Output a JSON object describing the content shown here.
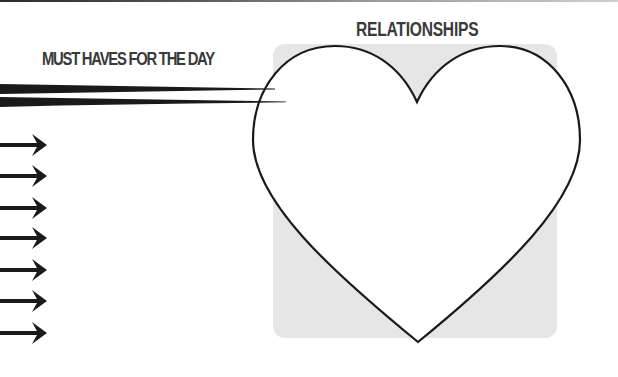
{
  "page": {
    "top_rule": true,
    "sections": {
      "must_haves": {
        "title": "MUST HAVES FOR THE DAY",
        "arrow_count": 7,
        "arrow_rows_y": [
          145,
          176,
          208,
          238,
          270,
          301,
          333
        ]
      },
      "relationships": {
        "title": "RELATIONSHIPS",
        "shape": "heart-icon",
        "box_fill": "#e6e6e6"
      }
    }
  },
  "colors": {
    "ink": "#1a1a1a",
    "title_text": "#3a3a3a",
    "panel_gray": "#e6e6e6",
    "background": "#ffffff"
  }
}
